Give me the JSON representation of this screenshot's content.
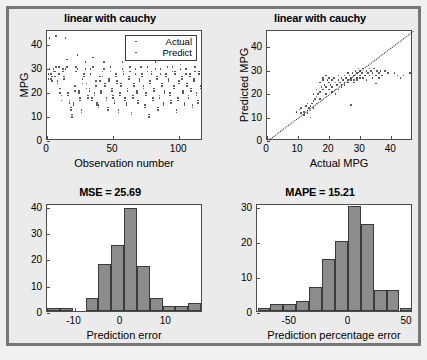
{
  "figure": {
    "background": "#ebebeb",
    "frame_color": "#777777",
    "axes_background": "#ffffff",
    "bar_fill": "#8c8c8c",
    "bar_edge": "#3a3a3a",
    "marker_color": "#3b3b3b"
  },
  "chart_data": [
    {
      "id": "observation-scatter",
      "type": "scatter",
      "title": "linear with cauchy",
      "xlabel": "Observation number",
      "ylabel": "MPG",
      "xlim": [
        0,
        118
      ],
      "ylim": [
        0,
        46
      ],
      "xticks": [
        0,
        50,
        100
      ],
      "yticks": [
        0,
        10,
        20,
        30,
        40
      ],
      "grid": false,
      "legend": {
        "position": "top-right",
        "entries": [
          "Actual",
          "Predict"
        ]
      },
      "series": [
        {
          "name": "Actual",
          "x": [
            1,
            2,
            3,
            4,
            5,
            6,
            7,
            8,
            9,
            10,
            11,
            12,
            13,
            14,
            15,
            16,
            17,
            18,
            19,
            20,
            21,
            22,
            23,
            24,
            25,
            26,
            27,
            28,
            29,
            30,
            31,
            32,
            33,
            34,
            35,
            36,
            37,
            38,
            39,
            40,
            41,
            42,
            43,
            44,
            45,
            46,
            47,
            48,
            49,
            50,
            51,
            52,
            53,
            54,
            55,
            56,
            57,
            58,
            59,
            60,
            61,
            62,
            63,
            64,
            65,
            66,
            67,
            68,
            69,
            70,
            71,
            72,
            73,
            74,
            75,
            76,
            77,
            78,
            79,
            80,
            81,
            82,
            83,
            84,
            85,
            86,
            87,
            88,
            89,
            90,
            91,
            92,
            93,
            94,
            95,
            96,
            97,
            98,
            99,
            100,
            101,
            102,
            103,
            104,
            105,
            106,
            107,
            108,
            109,
            110,
            111,
            112,
            113,
            114,
            115,
            116,
            117
          ],
          "y": [
            28,
            43,
            26,
            27,
            30,
            29,
            44,
            25,
            31,
            22,
            19,
            30,
            27,
            43,
            34,
            20,
            17,
            14,
            11,
            16,
            23,
            31,
            36,
            21,
            18,
            13,
            26,
            28,
            33,
            24,
            19,
            22,
            30,
            18,
            35,
            20,
            25,
            16,
            15,
            27,
            21,
            29,
            33,
            24,
            18,
            14,
            26,
            31,
            22,
            19,
            17,
            28,
            25,
            13,
            20,
            24,
            33,
            29,
            18,
            16,
            22,
            27,
            31,
            12,
            19,
            24,
            30,
            21,
            17,
            26,
            34,
            28,
            23,
            15,
            20,
            31,
            10,
            25,
            29,
            18,
            22,
            33,
            27,
            14,
            19,
            30,
            24,
            16,
            21,
            28,
            35,
            26,
            20,
            17,
            31,
            23,
            29,
            13,
            18,
            25,
            32,
            27,
            21,
            16,
            30,
            24,
            19,
            28,
            22,
            15,
            26,
            31,
            20,
            17,
            29,
            23,
            27
          ]
        },
        {
          "name": "Predict",
          "x": [
            1,
            2,
            3,
            4,
            5,
            6,
            7,
            8,
            9,
            10,
            11,
            12,
            13,
            14,
            15,
            16,
            17,
            18,
            19,
            20,
            21,
            22,
            23,
            24,
            25,
            26,
            27,
            28,
            29,
            30,
            31,
            32,
            33,
            34,
            35,
            36,
            37,
            38,
            39,
            40,
            41,
            42,
            43,
            44,
            45,
            46,
            47,
            48,
            49,
            50,
            51,
            52,
            53,
            54,
            55,
            56,
            57,
            58,
            59,
            60,
            61,
            62,
            63,
            64,
            65,
            66,
            67,
            68,
            69,
            70,
            71,
            72,
            73,
            74,
            75,
            76,
            77,
            78,
            79,
            80,
            81,
            82,
            83,
            84,
            85,
            86,
            87,
            88,
            89,
            90,
            91,
            92,
            93,
            94,
            95,
            96,
            97,
            98,
            99,
            100,
            101,
            102,
            103,
            104,
            105,
            106,
            107,
            108,
            109,
            110,
            111,
            112,
            113,
            114,
            115,
            116,
            117
          ],
          "y": [
            26,
            30,
            28,
            25,
            29,
            27,
            31,
            24,
            28,
            20,
            17,
            29,
            26,
            30,
            31,
            19,
            16,
            13,
            10,
            15,
            21,
            29,
            30,
            20,
            17,
            12,
            24,
            27,
            30,
            22,
            18,
            21,
            28,
            17,
            31,
            19,
            23,
            15,
            14,
            25,
            20,
            27,
            30,
            23,
            17,
            13,
            25,
            29,
            21,
            18,
            16,
            27,
            24,
            12,
            19,
            23,
            30,
            28,
            17,
            15,
            21,
            26,
            29,
            11,
            18,
            23,
            28,
            20,
            16,
            25,
            31,
            27,
            22,
            14,
            19,
            29,
            11,
            24,
            28,
            17,
            21,
            30,
            26,
            13,
            18,
            28,
            23,
            15,
            20,
            27,
            31,
            25,
            19,
            16,
            29,
            22,
            28,
            12,
            17,
            24,
            30,
            26,
            20,
            15,
            28,
            23,
            18,
            27,
            21,
            14,
            25,
            29,
            19,
            16,
            28,
            22,
            26
          ]
        }
      ]
    },
    {
      "id": "actual-vs-predicted",
      "type": "scatter",
      "title": "linear with cauchy",
      "xlabel": "Actual MPG",
      "ylabel": "Predicted MPG",
      "xlim": [
        0,
        47
      ],
      "ylim": [
        0,
        47
      ],
      "xticks": [
        0,
        10,
        20,
        30,
        40
      ],
      "yticks": [
        0,
        10,
        20,
        30,
        40
      ],
      "grid": false,
      "reference_line": {
        "type": "identity",
        "style": "dotted",
        "from": [
          0,
          0
        ],
        "to": [
          47,
          47
        ]
      },
      "points": [
        [
          9.5,
          12.5
        ],
        [
          10.5,
          13.5
        ],
        [
          11,
          14
        ],
        [
          12,
          12.5
        ],
        [
          12.5,
          15
        ],
        [
          13,
          16
        ],
        [
          13,
          13
        ],
        [
          13.5,
          14
        ],
        [
          14,
          10
        ],
        [
          14,
          13
        ],
        [
          14.5,
          16
        ],
        [
          15,
          17
        ],
        [
          15,
          14
        ],
        [
          15.5,
          18
        ],
        [
          16,
          19
        ],
        [
          16,
          16
        ],
        [
          16.5,
          20
        ],
        [
          17,
          18
        ],
        [
          17,
          21
        ],
        [
          17.5,
          23
        ],
        [
          18,
          22
        ],
        [
          18,
          27
        ],
        [
          18.5,
          24
        ],
        [
          19,
          23
        ],
        [
          19,
          20
        ],
        [
          19.5,
          26
        ],
        [
          20,
          25
        ],
        [
          20,
          22
        ],
        [
          20.5,
          24
        ],
        [
          21,
          26
        ],
        [
          21,
          23
        ],
        [
          21.5,
          27
        ],
        [
          22,
          25
        ],
        [
          22,
          22
        ],
        [
          22.5,
          24
        ],
        [
          23,
          26
        ],
        [
          23,
          28
        ],
        [
          23.5,
          25
        ],
        [
          24,
          27
        ],
        [
          24,
          24
        ],
        [
          24.5,
          26
        ],
        [
          25,
          28
        ],
        [
          25,
          25
        ],
        [
          25.5,
          27
        ],
        [
          26,
          29
        ],
        [
          26,
          26
        ],
        [
          26.5,
          28
        ],
        [
          27,
          15.5
        ],
        [
          27,
          27
        ],
        [
          27.5,
          29
        ],
        [
          28,
          26
        ],
        [
          28,
          28
        ],
        [
          28.5,
          30
        ],
        [
          29,
          27
        ],
        [
          29,
          29
        ],
        [
          29.5,
          31
        ],
        [
          30,
          28
        ],
        [
          30,
          30
        ],
        [
          30.5,
          29
        ],
        [
          31,
          27
        ],
        [
          31,
          31
        ],
        [
          31.5,
          28
        ],
        [
          32,
          30
        ],
        [
          32,
          26
        ],
        [
          32.5,
          29
        ],
        [
          33,
          31
        ],
        [
          33,
          28
        ],
        [
          33.5,
          30
        ],
        [
          34,
          27
        ],
        [
          34,
          29
        ],
        [
          34.5,
          31
        ],
        [
          35,
          28
        ],
        [
          35,
          24.5
        ],
        [
          35.5,
          30
        ],
        [
          36,
          29
        ],
        [
          36,
          27
        ],
        [
          36.5,
          30
        ],
        [
          37,
          28
        ],
        [
          38,
          30
        ],
        [
          39,
          29
        ],
        [
          41,
          29
        ],
        [
          42,
          28
        ],
        [
          43,
          27
        ],
        [
          44,
          28
        ],
        [
          46,
          29
        ],
        [
          15,
          20
        ],
        [
          16,
          22
        ],
        [
          17,
          25
        ],
        [
          18,
          26
        ],
        [
          19,
          28
        ],
        [
          20,
          27
        ],
        [
          21,
          21
        ],
        [
          22,
          20
        ],
        [
          23,
          22
        ],
        [
          24,
          23
        ],
        [
          25,
          24
        ],
        [
          26,
          25
        ],
        [
          27,
          26
        ],
        [
          28,
          25
        ],
        [
          29,
          26
        ],
        [
          30,
          27
        ],
        [
          14,
          15
        ],
        [
          13,
          12
        ],
        [
          12,
          11
        ],
        [
          11,
          12
        ]
      ]
    },
    {
      "id": "prediction-error-hist",
      "type": "bar",
      "title": "MSE = 25.69",
      "xlabel": "Prediction error",
      "ylabel": "",
      "xlim": [
        -16,
        18
      ],
      "ylim": [
        0,
        41
      ],
      "xticks": [
        -10,
        0,
        10
      ],
      "yticks": [
        0,
        10,
        20,
        30,
        40
      ],
      "bin_width": 2.8,
      "bin_centers": [
        -14.6,
        -11.8,
        -9.0,
        -6.2,
        -3.4,
        -0.6,
        2.2,
        5.0,
        7.8,
        10.6,
        13.4,
        16.2
      ],
      "values": [
        1,
        1,
        0,
        5,
        18,
        25,
        39,
        17,
        5,
        2,
        2,
        3
      ]
    },
    {
      "id": "prediction-percentage-error-hist",
      "type": "bar",
      "title": "MAPE = 15.21",
      "xlabel": "Prediction percentage error",
      "ylabel": "",
      "xlim": [
        -78,
        55
      ],
      "ylim": [
        0,
        31
      ],
      "xticks": [
        -50,
        0,
        50
      ],
      "yticks": [
        0,
        10,
        20,
        30
      ],
      "bin_width": 11,
      "bin_centers": [
        -72,
        -61,
        -50,
        -39,
        -28,
        -17,
        -6,
        5,
        16,
        27,
        38,
        49
      ],
      "values": [
        1,
        2,
        2,
        3,
        7,
        15,
        20,
        30,
        25,
        6,
        6,
        1
      ]
    }
  ]
}
